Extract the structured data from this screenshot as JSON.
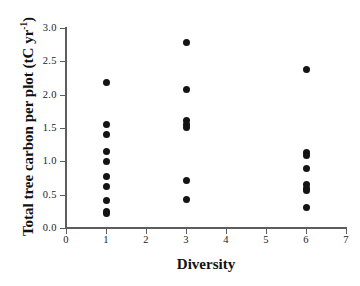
{
  "chart_data": {
    "type": "scatter",
    "title": "",
    "xlabel": "Diversity",
    "ylabel": "Total tree carbon per plot (tC yr",
    "ylabel_sup": "-1",
    "ylabel_tail": ")",
    "xlim": [
      0,
      7
    ],
    "ylim": [
      0,
      3.0
    ],
    "grid": false,
    "legend": "none",
    "xticks": [
      0,
      1,
      2,
      3,
      4,
      5,
      6,
      7
    ],
    "xtick_labels": [
      "0",
      "1",
      "2",
      "3",
      "4",
      "5",
      "6",
      "7"
    ],
    "yticks": [
      0.0,
      0.5,
      1.0,
      1.5,
      2.0,
      2.5,
      3.0
    ],
    "ytick_labels": [
      "0.0",
      "0.5",
      "1.0",
      "1.5",
      "2.0",
      "2.5",
      "3.0"
    ],
    "marker": "filled-circle",
    "marker_color": "#141414",
    "axis_color": "#5d5d5d",
    "series": [
      {
        "name": "Total tree carbon per plot",
        "points": [
          {
            "x": 1,
            "y": 2.19
          },
          {
            "x": 1,
            "y": 1.56
          },
          {
            "x": 1,
            "y": 1.41
          },
          {
            "x": 1,
            "y": 1.15
          },
          {
            "x": 1,
            "y": 1.0
          },
          {
            "x": 1,
            "y": 0.77
          },
          {
            "x": 1,
            "y": 0.63
          },
          {
            "x": 1,
            "y": 0.42
          },
          {
            "x": 1,
            "y": 0.25
          },
          {
            "x": 1,
            "y": 0.22
          },
          {
            "x": 3,
            "y": 2.78
          },
          {
            "x": 3,
            "y": 2.08
          },
          {
            "x": 3,
            "y": 1.62
          },
          {
            "x": 3,
            "y": 1.55
          },
          {
            "x": 3,
            "y": 1.51
          },
          {
            "x": 3,
            "y": 0.71
          },
          {
            "x": 3,
            "y": 0.43
          },
          {
            "x": 6,
            "y": 2.38
          },
          {
            "x": 6,
            "y": 1.13
          },
          {
            "x": 6,
            "y": 1.09
          },
          {
            "x": 6,
            "y": 0.89
          },
          {
            "x": 6,
            "y": 0.66
          },
          {
            "x": 6,
            "y": 0.6
          },
          {
            "x": 6,
            "y": 0.57
          },
          {
            "x": 6,
            "y": 0.31
          }
        ]
      }
    ]
  }
}
